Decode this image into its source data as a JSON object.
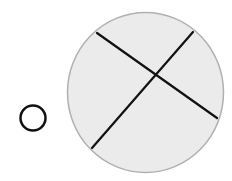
{
  "diagram": {
    "colors": {
      "background": "#ffffff",
      "large_circle_fill": "#ebebeb",
      "large_circle_stroke": "#b0b0b0",
      "chord_stroke": "#111111",
      "small_circle_stroke": "#111111"
    },
    "small_circle": {
      "cx": 33,
      "cy": 118,
      "r": 12.5,
      "stroke_width": 2.5
    },
    "large_circle": {
      "cx": 145.5,
      "cy": 92.5,
      "rx": 78,
      "ry": 80,
      "stroke_width": 1.5
    },
    "chords": [
      {
        "x1": 97,
        "y1": 33,
        "x2": 217,
        "y2": 118
      },
      {
        "x1": 193,
        "y1": 32,
        "x2": 92,
        "y2": 148
      }
    ]
  }
}
